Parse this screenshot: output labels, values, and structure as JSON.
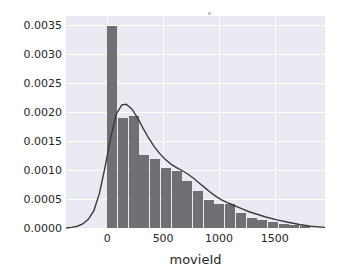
{
  "figure": {
    "background": "#ffffff",
    "plot_background": "#eaeaf2",
    "grid_color": "#ffffff",
    "bar_color": "#6f6f74",
    "kde_color": "#3b3b3f",
    "tick_color": "#262626"
  },
  "chart_data": {
    "type": "bar",
    "title": "",
    "subtitle": "",
    "xlabel": "movieId",
    "ylabel": "",
    "grid": true,
    "legend": null,
    "xlim": [
      -370,
      1950
    ],
    "ylim": [
      0.0,
      0.00365
    ],
    "xticks": [
      0,
      500,
      1000,
      1500
    ],
    "xticklabels": [
      "0",
      "500",
      "1000",
      "1500"
    ],
    "yticks": [
      0.0,
      0.0005,
      0.001,
      0.0015,
      0.002,
      0.0025,
      0.003,
      0.0035
    ],
    "yticklabels": [
      "0.0000",
      "0.0005",
      "0.0010",
      "0.0015",
      "0.0020",
      "0.0025",
      "0.0030",
      "0.0035"
    ],
    "bin_width": 96,
    "bins": [
      {
        "x0": 0,
        "x1": 96,
        "density": 0.00347
      },
      {
        "x0": 96,
        "x1": 192,
        "density": 0.0019
      },
      {
        "x0": 192,
        "x1": 288,
        "density": 0.00192
      },
      {
        "x0": 288,
        "x1": 384,
        "density": 0.00126
      },
      {
        "x0": 384,
        "x1": 480,
        "density": 0.00119
      },
      {
        "x0": 480,
        "x1": 576,
        "density": 0.00104
      },
      {
        "x0": 576,
        "x1": 672,
        "density": 0.00098
      },
      {
        "x0": 672,
        "x1": 768,
        "density": 0.00081
      },
      {
        "x0": 768,
        "x1": 864,
        "density": 0.00063
      },
      {
        "x0": 864,
        "x1": 960,
        "density": 0.00049
      },
      {
        "x0": 960,
        "x1": 1056,
        "density": 0.00042
      },
      {
        "x0": 1056,
        "x1": 1152,
        "density": 0.00042
      },
      {
        "x0": 1152,
        "x1": 1248,
        "density": 0.00025
      },
      {
        "x0": 1248,
        "x1": 1344,
        "density": 0.00017
      },
      {
        "x0": 1344,
        "x1": 1440,
        "density": 0.00014
      },
      {
        "x0": 1440,
        "x1": 1536,
        "density": 0.0001
      },
      {
        "x0": 1536,
        "x1": 1632,
        "density": 7e-05
      },
      {
        "x0": 1632,
        "x1": 1728,
        "density": 5e-05
      },
      {
        "x0": 1728,
        "x1": 1824,
        "density": 3e-05
      }
    ],
    "kde": {
      "name": "density-curve",
      "x": [
        -370,
        -320,
        -270,
        -220,
        -170,
        -120,
        -70,
        -20,
        30,
        80,
        130,
        170,
        220,
        270,
        320,
        370,
        420,
        470,
        520,
        570,
        620,
        670,
        720,
        770,
        820,
        870,
        920,
        970,
        1020,
        1070,
        1120,
        1170,
        1220,
        1270,
        1320,
        1420,
        1520,
        1620,
        1720,
        1820,
        1950
      ],
      "y": [
        0.0,
        1e-05,
        3e-05,
        7e-05,
        0.00015,
        0.0003,
        0.0006,
        0.00105,
        0.00155,
        0.00196,
        0.00212,
        0.00213,
        0.00205,
        0.0019,
        0.00172,
        0.00155,
        0.0014,
        0.00128,
        0.00118,
        0.0011,
        0.00104,
        0.00099,
        0.00093,
        0.00086,
        0.00078,
        0.0007,
        0.00062,
        0.00055,
        0.00049,
        0.00044,
        0.0004,
        0.00036,
        0.00032,
        0.00028,
        0.00025,
        0.00019,
        0.00014,
        0.0001,
        6e-05,
        3e-05,
        1e-05
      ]
    }
  }
}
